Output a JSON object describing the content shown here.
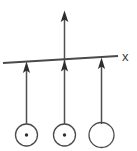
{
  "diagram": {
    "type": "physics-field-diagram",
    "background_color": "#ffffff",
    "stroke_color": "#444444",
    "axis": {
      "label": "x",
      "label_x": 126,
      "label_y": 56,
      "line_start_x": 3,
      "line_start_y": 63,
      "line_end_x": 118,
      "line_end_y": 56,
      "stroke_width": 1.6
    },
    "vertical_axis": {
      "name": "center-vertical-arrow",
      "x": 64,
      "top_y": 11,
      "bottom_y": 124,
      "arrow_tip_y": 11,
      "stroke_width": 1.4
    },
    "field_vectors": [
      {
        "name": "field-vector-left",
        "x": 26,
        "tail_y": 124,
        "tip_y": 62,
        "direction": "up",
        "stroke_width": 1.4
      },
      {
        "name": "field-vector-center",
        "x": 64,
        "tail_y": 124,
        "tip_y": 60,
        "direction": "up",
        "stroke_width": 1.4
      },
      {
        "name": "field-vector-right",
        "x": 101,
        "tail_y": 124,
        "tip_y": 58,
        "direction": "up",
        "stroke_width": 1.4
      }
    ],
    "conductors": [
      {
        "name": "conductor-left",
        "cx": 26,
        "cy": 135,
        "r": 11,
        "has_center_dot": true,
        "dot_r": 1.6,
        "current_direction": "out-of-page"
      },
      {
        "name": "conductor-center",
        "cx": 64,
        "cy": 135,
        "r": 11,
        "has_center_dot": true,
        "dot_r": 1.6,
        "current_direction": "out-of-page"
      },
      {
        "name": "conductor-right",
        "cx": 101,
        "cy": 135,
        "r": 12.5,
        "has_center_dot": false,
        "dot_r": 0,
        "current_direction": "none"
      }
    ]
  }
}
